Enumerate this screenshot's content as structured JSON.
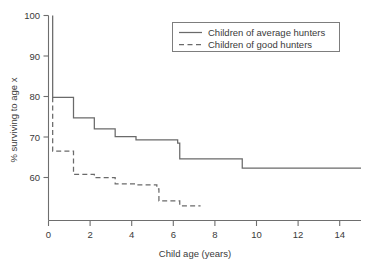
{
  "chart_data": {
    "type": "line",
    "title": "",
    "subtitle": "",
    "xlabel": "Child age (years)",
    "ylabel": "% surviving to age x",
    "xlim": [
      0,
      15
    ],
    "ylim": [
      52,
      100
    ],
    "xticks": [
      0,
      2,
      4,
      6,
      8,
      10,
      12,
      14
    ],
    "xtick_labels": [
      "0",
      "2",
      "4",
      "6",
      "8",
      "10",
      "12",
      "14"
    ],
    "yticks": [
      60,
      70,
      80,
      90,
      100
    ],
    "ytick_labels": [
      "60",
      "70",
      "80",
      "90",
      "100"
    ],
    "grid": false,
    "legend_position": "top-right",
    "step_style": "post",
    "series": [
      {
        "name": "Children of average hunters",
        "style": "solid",
        "color": "#6a6a6a",
        "x": [
          0.2,
          0.2,
          1.2,
          1.2,
          2.2,
          2.2,
          3.2,
          3.2,
          4.2,
          4.2,
          6.2,
          6.2,
          6.3,
          6.3,
          9.3,
          9.3,
          15.0
        ],
        "y": [
          100.0,
          79.8,
          79.8,
          74.7,
          74.7,
          72.0,
          72.0,
          70.1,
          70.1,
          69.3,
          69.3,
          68.5,
          68.5,
          64.6,
          64.6,
          62.3,
          62.3
        ]
      },
      {
        "name": "Children of good hunters",
        "style": "dashed",
        "color": "#6a6a6a",
        "x": [
          0.2,
          0.2,
          1.2,
          1.2,
          2.2,
          2.2,
          3.2,
          3.2,
          4.2,
          4.2,
          5.2,
          5.2,
          5.3,
          5.3,
          6.3,
          6.3,
          7.3
        ],
        "y": [
          79.8,
          66.5,
          66.5,
          60.8,
          60.8,
          60.0,
          60.0,
          58.4,
          58.4,
          58.2,
          58.2,
          57.2,
          57.2,
          54.2,
          54.2,
          53.0,
          53.0
        ]
      }
    ],
    "legend_entries": [
      {
        "label": "Children of average hunters",
        "style": "solid"
      },
      {
        "label": "Children of good hunters",
        "style": "dashed"
      }
    ]
  },
  "axes": {
    "y_axis_title": "% surviving to age x",
    "x_axis_title": "Child age (years)"
  }
}
